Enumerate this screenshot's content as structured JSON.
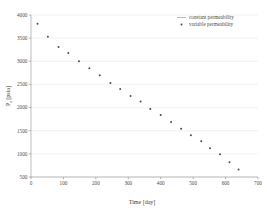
{
  "chart_data": {
    "type": "scatter",
    "title": "",
    "xlabel": "Time [day]",
    "ylabel": "P_r [psia]",
    "xlim": [
      0,
      700
    ],
    "ylim": [
      500,
      4000
    ],
    "xticks": [
      0,
      100,
      200,
      300,
      400,
      500,
      600,
      700
    ],
    "yticks": [
      500,
      1000,
      1500,
      2000,
      2500,
      3000,
      3500,
      4000
    ],
    "xtick_labels": [
      "0",
      "100",
      "200",
      "300",
      "400",
      "500",
      "600",
      "700"
    ],
    "ytick_labels": [
      "500",
      "1000",
      "1500",
      "2000",
      "2500",
      "3000",
      "3500",
      "4000"
    ],
    "grid": true,
    "grid_axis": "y",
    "legend_position": "top-right",
    "legend": [
      {
        "name": "constant permeability",
        "marker": "line"
      },
      {
        "name": "variable permeability",
        "marker": "dot"
      }
    ],
    "series": [
      {
        "name": "variable permeability",
        "marker": "dot",
        "color": "#4a4a52",
        "points": [
          {
            "x": 20,
            "y": 3810
          },
          {
            "x": 52,
            "y": 3530
          },
          {
            "x": 85,
            "y": 3310
          },
          {
            "x": 115,
            "y": 3180
          },
          {
            "x": 148,
            "y": 3000
          },
          {
            "x": 180,
            "y": 2850
          },
          {
            "x": 212,
            "y": 2700
          },
          {
            "x": 245,
            "y": 2530
          },
          {
            "x": 275,
            "y": 2400
          },
          {
            "x": 307,
            "y": 2250
          },
          {
            "x": 338,
            "y": 2130
          },
          {
            "x": 368,
            "y": 1970
          },
          {
            "x": 400,
            "y": 1840
          },
          {
            "x": 432,
            "y": 1690
          },
          {
            "x": 463,
            "y": 1540
          },
          {
            "x": 493,
            "y": 1400
          },
          {
            "x": 525,
            "y": 1270
          },
          {
            "x": 552,
            "y": 1120
          },
          {
            "x": 583,
            "y": 990
          },
          {
            "x": 612,
            "y": 820
          },
          {
            "x": 640,
            "y": 660
          }
        ]
      }
    ]
  },
  "axes": {
    "y_title_main": "P",
    "y_title_sub": "r",
    "y_title_unit": " [psia]"
  }
}
